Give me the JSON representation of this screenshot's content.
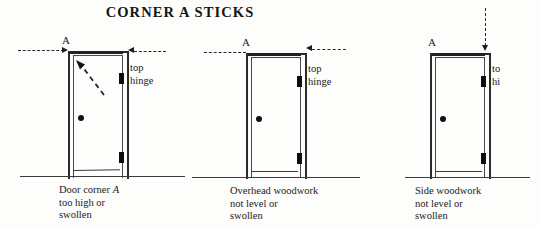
{
  "figure": {
    "title": "CORNER A STICKS",
    "background_color": "#fdfdfb",
    "ink_color": "#1a1a1a"
  },
  "panels": [
    {
      "id": "panel-door-corner-high",
      "corner_label": "A",
      "hinge_label_line1": "top",
      "hinge_label_line2": "hinge",
      "caption_line1_pre": "Door corner ",
      "caption_line1_italic": "A",
      "caption_line2": "too high or",
      "caption_line3": "swollen",
      "annotations": {
        "left_dashed_guide": "horizontal dashed level line entering from left with arrowhead",
        "right_dashed_arrow": "horizontal dashed arrow pointing left at top hinge level",
        "interior_diagonal_arrow": "diagonal dashed arrow pointing up-left toward corner A"
      }
    },
    {
      "id": "panel-overhead-woodwork",
      "corner_label": "A",
      "hinge_label_line1": "top",
      "hinge_label_line2": "hinge",
      "caption_line1": "Overhead woodwork",
      "caption_line2": "not level or",
      "caption_line3": "swollen",
      "annotations": {
        "left_dashed_guide": "horizontal dashed level line entering from left",
        "right_dashed_arrow": "horizontal dashed arrow pointing left at door head"
      }
    },
    {
      "id": "panel-side-woodwork",
      "corner_label": "A",
      "hinge_label_line1": "to",
      "hinge_label_line2": "hi",
      "caption_line1": "Side woodwork",
      "caption_line2": "not level or",
      "caption_line3": "swollen",
      "annotations": {
        "top_dashed_arrow": "vertical dashed arrow pointing down onto the top hinge jamb"
      }
    }
  ]
}
